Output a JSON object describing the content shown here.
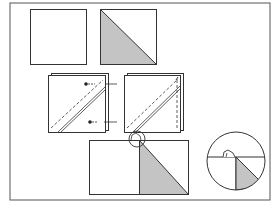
{
  "diagram": {
    "title": "",
    "colors": {
      "line": "#333333",
      "shade": "#c4c4c4",
      "background": "#ffffff",
      "frame": "#555555"
    },
    "steps": [
      {
        "id": "plain-square",
        "label": ""
      },
      {
        "id": "shaded-square",
        "label": ""
      },
      {
        "id": "layered-square-pinned",
        "label": ""
      },
      {
        "id": "layered-square-sewn",
        "label": ""
      },
      {
        "id": "pressed-unit",
        "label": ""
      },
      {
        "id": "detail-magnifier",
        "label": ""
      }
    ]
  }
}
